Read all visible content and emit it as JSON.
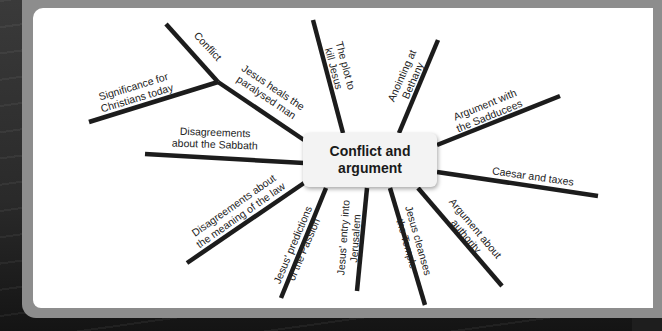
{
  "mind_map": {
    "center": {
      "title": "Conflict and argument"
    },
    "branches": [
      {
        "id": "conflict",
        "label": "Conflict"
      },
      {
        "id": "jesus-heals",
        "label": "Jesus heals the paralysed man"
      },
      {
        "id": "significance",
        "label": "Significance for Christians today"
      },
      {
        "id": "sabbath",
        "label": "Disagreements about the Sabbath"
      },
      {
        "id": "law",
        "label": "Disagreements about the meaning of the law"
      },
      {
        "id": "predictions",
        "label": "Jesus' predictions of the Passion"
      },
      {
        "id": "entry",
        "label": "Jesus' entry into Jerusalem"
      },
      {
        "id": "cleanses",
        "label": "Jesus cleanses the Temple"
      },
      {
        "id": "authority",
        "label": "Argument about authority"
      },
      {
        "id": "caesar",
        "label": "Caesar and taxes"
      },
      {
        "id": "sadducees",
        "label": "Argument with the Sadducees"
      },
      {
        "id": "anointing",
        "label": "Anointing at Bethany"
      },
      {
        "id": "plot",
        "label": "The plot to kill Jesus"
      }
    ],
    "labels_display": {
      "conflict": [
        "Conflict"
      ],
      "jesus-heals": [
        "Jesus heals the",
        "paralysed man"
      ],
      "significance": [
        "Significance for",
        "Christians today"
      ],
      "sabbath": [
        "Disagreements",
        "about the Sabbath"
      ],
      "law": [
        "Disagreements about",
        "the meaning of the law"
      ],
      "predictions": [
        "Jesus' predictions",
        "of the Passion"
      ],
      "entry": [
        "Jesus' entry into",
        "Jerusalem"
      ],
      "cleanses": [
        "Jesus cleanses",
        "the Temple"
      ],
      "authority": [
        "Argument about",
        "authority"
      ],
      "caesar": [
        "Caesar and taxes"
      ],
      "sadducees": [
        "Argument with",
        "the Sadducees"
      ],
      "anointing": [
        "Anointing at",
        "Bethany"
      ],
      "plot": [
        "The plot to",
        "kill Jesus"
      ]
    }
  },
  "colors": {
    "line": "#1c1c1c",
    "card": "#ffffff",
    "center_box": "#f3f3f3",
    "frame": "#8d8d8d",
    "background": "#1e1e1e"
  }
}
